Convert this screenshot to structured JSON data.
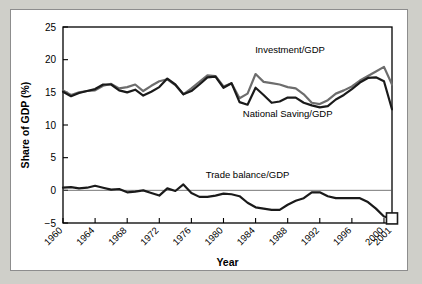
{
  "chart_data": {
    "type": "line",
    "title": "",
    "xlabel": "Year",
    "ylabel": "Share of GDP (%)",
    "ylim": [
      -5,
      25
    ],
    "yticks": [
      -5,
      0,
      5,
      10,
      15,
      20,
      25
    ],
    "ytick_labels": [
      "−5",
      "0",
      "5",
      "10",
      "15",
      "20",
      "25"
    ],
    "xlim": [
      1960,
      2001
    ],
    "xticks": [
      1960,
      1964,
      1968,
      1972,
      1976,
      1980,
      1984,
      1988,
      1992,
      1996,
      2000,
      2001
    ],
    "xtick_labels": [
      "1960",
      "1964",
      "1968",
      "1972",
      "1976",
      "1980",
      "1984",
      "1988",
      "1992",
      "1996",
      "2000",
      "2001"
    ],
    "grid": false,
    "legend_position": "inline-annotations",
    "zero_line": true,
    "x": [
      1960,
      1961,
      1962,
      1963,
      1964,
      1965,
      1966,
      1967,
      1968,
      1969,
      1970,
      1971,
      1972,
      1973,
      1974,
      1975,
      1976,
      1977,
      1978,
      1979,
      1980,
      1981,
      1982,
      1983,
      1984,
      1985,
      1986,
      1987,
      1988,
      1989,
      1990,
      1991,
      1992,
      1993,
      1994,
      1995,
      1996,
      1997,
      1998,
      1999,
      2000,
      2001
    ],
    "series": [
      {
        "name": "Investment/GDP",
        "color": "#6d6d6d",
        "values": [
          15.3,
          14.6,
          15.0,
          15.2,
          15.3,
          16.0,
          16.3,
          15.6,
          15.8,
          16.2,
          15.2,
          16.0,
          16.7,
          17.0,
          16.1,
          14.7,
          15.6,
          16.6,
          17.6,
          17.5,
          15.9,
          16.4,
          14.1,
          14.8,
          17.8,
          16.6,
          16.4,
          16.2,
          15.8,
          15.6,
          14.7,
          13.4,
          13.2,
          13.8,
          14.8,
          15.3,
          15.9,
          16.8,
          17.5,
          18.2,
          18.9,
          16.2
        ]
      },
      {
        "name": "National Saving/GDP",
        "color": "#1a1a1a",
        "values": [
          15.1,
          14.4,
          14.9,
          15.2,
          15.5,
          16.2,
          16.2,
          15.3,
          15.0,
          15.4,
          14.5,
          15.1,
          15.8,
          17.1,
          16.2,
          14.7,
          15.2,
          16.2,
          17.3,
          17.4,
          15.7,
          16.4,
          13.5,
          13.1,
          15.7,
          14.6,
          13.4,
          13.6,
          14.2,
          14.2,
          13.4,
          13.0,
          12.7,
          12.9,
          13.9,
          14.6,
          15.5,
          16.5,
          17.2,
          17.3,
          16.7,
          12.4
        ]
      },
      {
        "name": "Trade balance/GDP",
        "color": "#1a1a1a",
        "values": [
          0.4,
          0.5,
          0.3,
          0.4,
          0.7,
          0.4,
          0.1,
          0.2,
          -0.3,
          -0.2,
          0.0,
          -0.4,
          -0.8,
          0.3,
          -0.1,
          0.9,
          -0.4,
          -1.0,
          -1.0,
          -0.8,
          -0.5,
          -0.6,
          -0.9,
          -1.9,
          -2.6,
          -2.8,
          -3.0,
          -3.0,
          -2.2,
          -1.6,
          -1.2,
          -0.3,
          -0.3,
          -0.9,
          -1.2,
          -1.2,
          -1.2,
          -1.2,
          -1.8,
          -2.8,
          -4.0,
          -4.3
        ]
      }
    ],
    "annotations": [
      {
        "text": "Investment/GDP",
        "x": 1988.3,
        "y": 21.0
      },
      {
        "text": "National Saving/GDP",
        "x": 1988.0,
        "y": 11.3
      },
      {
        "text": "Trade balance/GDP",
        "x": 1983.0,
        "y": 1.9
      }
    ],
    "end_marker": {
      "series": "Trade balance/GDP",
      "x": 2001,
      "shape": "open-square",
      "note": "projection endpoint box"
    }
  }
}
